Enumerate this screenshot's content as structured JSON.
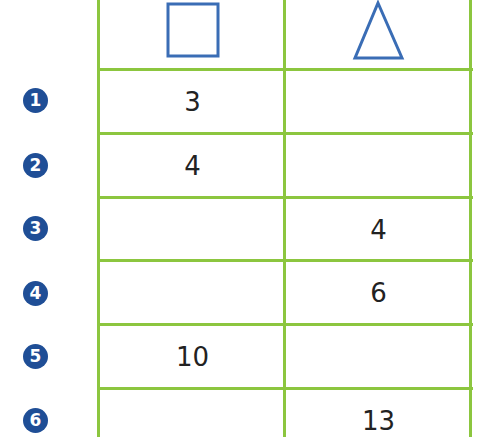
{
  "table": {
    "columns": [
      {
        "header_icon": "square-icon",
        "shape": "square"
      },
      {
        "header_icon": "triangle-icon",
        "shape": "triangle"
      }
    ],
    "rows": [
      {
        "number": "1",
        "square": "3",
        "triangle": ""
      },
      {
        "number": "2",
        "square": "4",
        "triangle": ""
      },
      {
        "number": "3",
        "square": "",
        "triangle": "4"
      },
      {
        "number": "4",
        "square": "",
        "triangle": "6"
      },
      {
        "number": "5",
        "square": "10",
        "triangle": ""
      },
      {
        "number": "6",
        "square": "",
        "triangle": "13"
      }
    ]
  },
  "colors": {
    "grid_line": "#8cc63f",
    "shape_outline": "#3a6db5",
    "badge_fill": "#1f4e96",
    "badge_text": "#ffffff",
    "cell_text": "#222222"
  }
}
